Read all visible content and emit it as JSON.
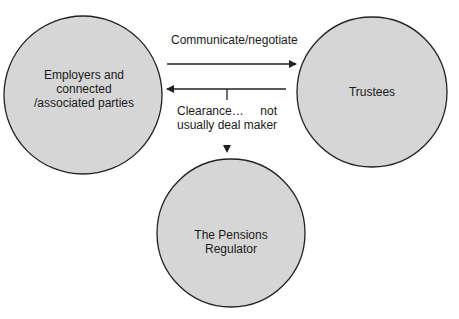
{
  "diagram": {
    "nodes": [
      {
        "id": "employers",
        "label": "Employers and\nconnected\n/associated parties"
      },
      {
        "id": "trustees",
        "label": "Trustees"
      },
      {
        "id": "regulator",
        "label": "The Pensions\nRegulator"
      }
    ],
    "edges": [
      {
        "from": "employers",
        "to": "trustees",
        "label": "Communicate/negotiate"
      },
      {
        "from": "trustees",
        "to": "employers",
        "label": ""
      },
      {
        "from": "edge-trustees-employers",
        "to": "regulator",
        "label": "Clearance…     not\nusually deal maker"
      }
    ],
    "colors": {
      "node_fill": "#d6d6d6",
      "stroke": "#222222"
    }
  }
}
